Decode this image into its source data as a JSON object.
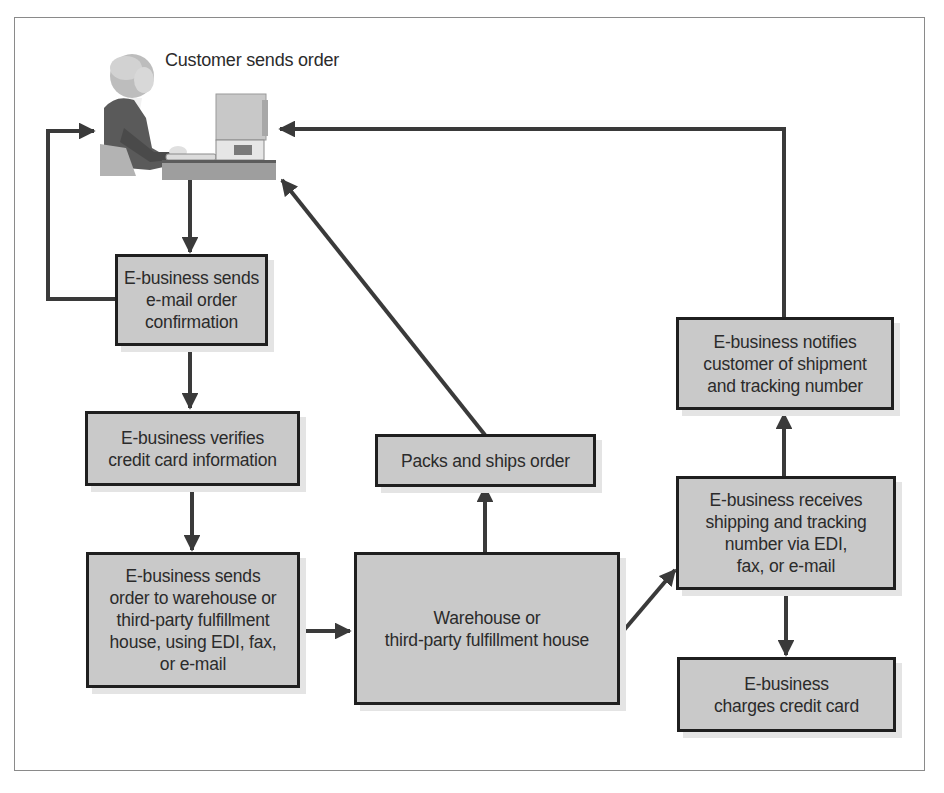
{
  "diagram": {
    "start_node": {
      "label": "Customer sends order",
      "icon": "customer-at-computer-illustration"
    },
    "nodes": [
      {
        "id": "email_confirmation",
        "label": "E-business sends\ne-mail order\nconfirmation"
      },
      {
        "id": "verify_card",
        "label": "E-business verifies\ncredit card information"
      },
      {
        "id": "send_to_warehouse",
        "label": "E-business sends\norder to warehouse or\nthird-party fulfillment\nhouse, using EDI, fax,\nor e-mail"
      },
      {
        "id": "warehouse",
        "label": "Warehouse or\nthird-party fulfillment house"
      },
      {
        "id": "packs_ships",
        "label": "Packs and ships order"
      },
      {
        "id": "receives_tracking",
        "label": "E-business receives\nshipping and tracking\nnumber via EDI,\nfax, or e-mail"
      },
      {
        "id": "notifies_customer",
        "label": "E-business notifies\ncustomer of shipment\nand tracking number"
      },
      {
        "id": "charges_card",
        "label": "E-business\ncharges credit card"
      }
    ],
    "edges": [
      {
        "from": "customer",
        "to": "email_confirmation"
      },
      {
        "from": "email_confirmation",
        "to": "customer"
      },
      {
        "from": "email_confirmation",
        "to": "verify_card"
      },
      {
        "from": "verify_card",
        "to": "send_to_warehouse"
      },
      {
        "from": "send_to_warehouse",
        "to": "warehouse"
      },
      {
        "from": "warehouse",
        "to": "packs_ships"
      },
      {
        "from": "packs_ships",
        "to": "customer"
      },
      {
        "from": "warehouse",
        "to": "receives_tracking"
      },
      {
        "from": "receives_tracking",
        "to": "notifies_customer"
      },
      {
        "from": "receives_tracking",
        "to": "charges_card"
      },
      {
        "from": "notifies_customer",
        "to": "customer"
      }
    ],
    "colors": {
      "box_fill": "#c9c9c9",
      "box_border": "#1f1f1f",
      "arrow": "#3a3a3a",
      "frame_border": "#8a8a8a",
      "background": "#ffffff"
    }
  }
}
